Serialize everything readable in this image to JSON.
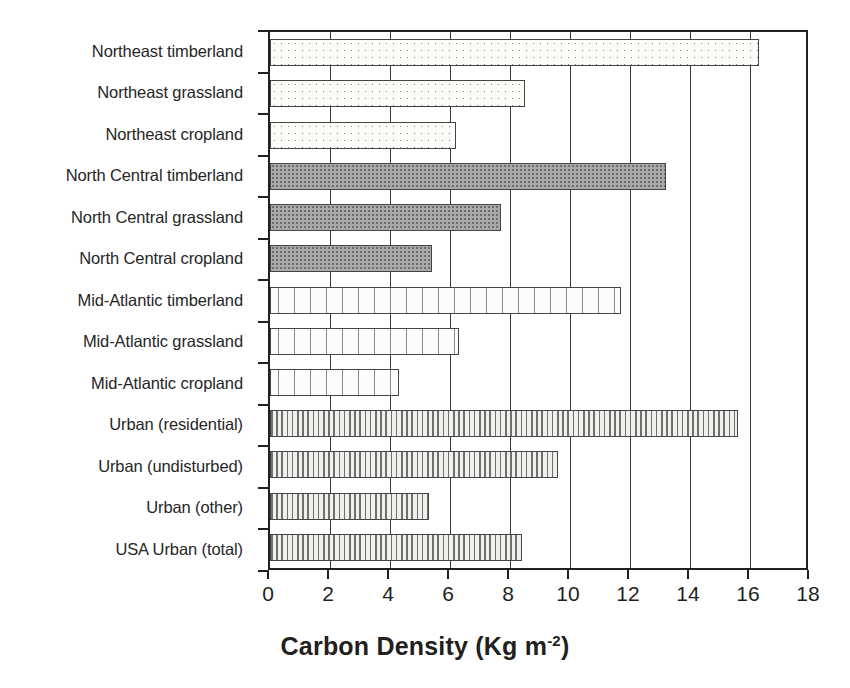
{
  "chart_data": {
    "type": "bar",
    "orientation": "horizontal",
    "title": "",
    "xlabel": "Carbon Density (Kg m-2)",
    "xlabel_base": "Carbon Density (Kg m",
    "xlabel_sup": "-2",
    "xlabel_close": ")",
    "ylabel": "",
    "xlim": [
      0,
      18
    ],
    "xticks": [
      0,
      2,
      4,
      6,
      8,
      10,
      12,
      14,
      16,
      18
    ],
    "grid": "vertical gridlines at every x tick",
    "legend": "none",
    "categories": [
      "Northeast timberland",
      "Northeast grassland",
      "Northeast cropland",
      "North Central timberland",
      "North Central grassland",
      "North Central cropland",
      "Mid-Atlantic timberland",
      "Mid-Atlantic grassland",
      "Mid-Atlantic cropland",
      "Urban (residential)",
      "Urban (undisturbed)",
      "Urban (other)",
      "USA Urban (total)"
    ],
    "values": [
      16.3,
      8.5,
      6.2,
      13.2,
      7.7,
      5.4,
      11.7,
      6.3,
      4.3,
      15.6,
      9.6,
      5.3,
      8.4
    ],
    "bar_patterns": [
      "dotted-light",
      "dotted-light",
      "dotted-light",
      "dense-gray",
      "dense-gray",
      "dense-gray",
      "dashed-speckle",
      "dashed-speckle",
      "dashed-speckle",
      "vertical-stripe",
      "vertical-stripe",
      "vertical-stripe",
      "vertical-stripe"
    ],
    "colors": {
      "axis": "#231f20",
      "grid": "#3a3a3a",
      "bar_outline": "#444444",
      "dotted_light_fill": "#fbfbf8",
      "dense_gray_fill": "#a9a9a9",
      "dashed_speckle_fill": "#fcfcfa",
      "vertical_stripe_fill": "#f2f2ee",
      "background": "#ffffff"
    }
  }
}
